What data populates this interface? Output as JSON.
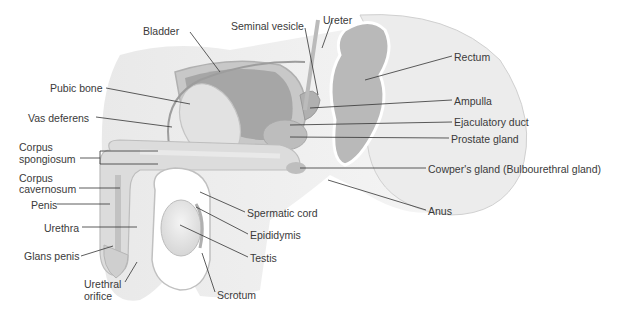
{
  "diagram": {
    "labels": [
      {
        "id": "bladder",
        "text": "Bladder",
        "x": 143,
        "y": 25
      },
      {
        "id": "seminal-vesicle",
        "text": "Seminal vesicle",
        "x": 260,
        "y": 20
      },
      {
        "id": "ureter",
        "text": "Ureter",
        "x": 323,
        "y": 14
      },
      {
        "id": "rectum",
        "text": "Rectum",
        "x": 454,
        "y": 51
      },
      {
        "id": "pubic-bone",
        "text": "Pubic bone",
        "x": 50,
        "y": 82
      },
      {
        "id": "ampulla",
        "text": "Ampulla",
        "x": 454,
        "y": 95
      },
      {
        "id": "vas-deferens",
        "text": "Vas deferens",
        "x": 28,
        "y": 112
      },
      {
        "id": "ejaculatory-duct",
        "text": "Ejaculatory duct",
        "x": 454,
        "y": 116
      },
      {
        "id": "prostate-gland",
        "text": "Prostate gland",
        "x": 451,
        "y": 133
      },
      {
        "id": "corpus-spongiosum-1",
        "text": "Corpus",
        "x": 19,
        "y": 141
      },
      {
        "id": "corpus-spongiosum-2",
        "text": "spongiosum",
        "x": 19,
        "y": 153
      },
      {
        "id": "cowpers-gland",
        "text": "Cowper's gland (Bulbourethral gland)",
        "x": 428,
        "y": 163
      },
      {
        "id": "corpus-cavernosum-1",
        "text": "Corpus",
        "x": 19,
        "y": 172
      },
      {
        "id": "corpus-cavernosum-2",
        "text": "cavernosum",
        "x": 19,
        "y": 183
      },
      {
        "id": "penis",
        "text": "Penis",
        "x": 31,
        "y": 199
      },
      {
        "id": "anus",
        "text": "Anus",
        "x": 428,
        "y": 207
      },
      {
        "id": "spermatic-cord",
        "text": "Spermatic cord",
        "x": 247,
        "y": 208
      },
      {
        "id": "urethra",
        "text": "Urethra",
        "x": 44,
        "y": 222
      },
      {
        "id": "epididymis",
        "text": "Epididymis",
        "x": 250,
        "y": 230
      },
      {
        "id": "glans-penis",
        "text": "Glans penis",
        "x": 24,
        "y": 250
      },
      {
        "id": "testis",
        "text": "Testis",
        "x": 250,
        "y": 253
      },
      {
        "id": "urethral-orifice-1",
        "text": "Urethral",
        "x": 84,
        "y": 278
      },
      {
        "id": "urethral-orifice-2",
        "text": "orifice",
        "x": 84,
        "y": 290
      },
      {
        "id": "scrotum",
        "text": "Scrotum",
        "x": 217,
        "y": 291
      }
    ],
    "colors": {
      "tissue_light": "#e8e8e8",
      "tissue_mid": "#cfcfcf",
      "tissue_dark": "#9a9a9a",
      "leader_line": "#333333",
      "text": "#3a3a3a"
    }
  }
}
